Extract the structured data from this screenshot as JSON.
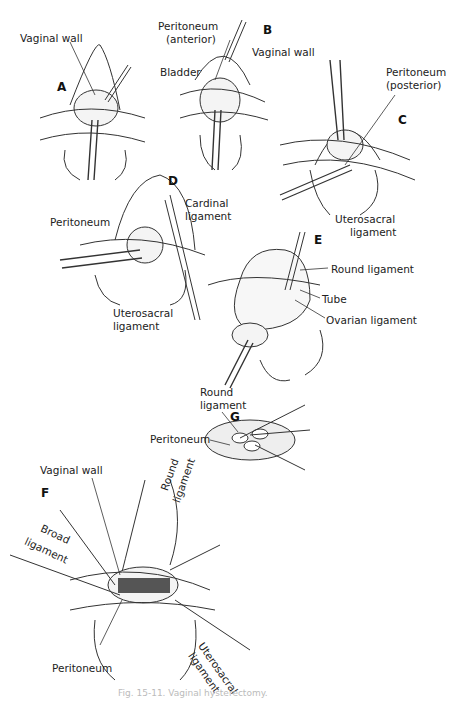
{
  "figure": {
    "caption": "Fig. 15-11. Vaginal hysterectomy.",
    "panels": [
      {
        "id": "A",
        "labels": [
          "Vaginal wall"
        ]
      },
      {
        "id": "B",
        "labels": [
          "Peritoneum (anterior)",
          "Bladder",
          "Vaginal wall"
        ]
      },
      {
        "id": "C",
        "labels": [
          "Peritoneum (posterior)",
          "Uterosacral ligament"
        ]
      },
      {
        "id": "D",
        "labels": [
          "Peritoneum",
          "Cardinal ligament",
          "Uterosacral ligament"
        ]
      },
      {
        "id": "E",
        "labels": [
          "Round ligament",
          "Tube",
          "Ovarian ligament"
        ]
      },
      {
        "id": "F",
        "labels": [
          "Vaginal wall",
          "Round ligament",
          "Broad ligament",
          "Peritoneum",
          "Uterosacral ligament"
        ]
      },
      {
        "id": "G",
        "labels": [
          "Round ligament",
          "Peritoneum"
        ]
      }
    ]
  },
  "letters": {
    "a": "A",
    "b": "B",
    "c": "C",
    "d": "D",
    "e": "E",
    "f": "F",
    "g": "G"
  },
  "labels": {
    "a_vaginal_wall": "Vaginal wall",
    "b_peritoneum_1": "Peritoneum",
    "b_peritoneum_2": "(anterior)",
    "b_bladder": "Bladder",
    "b_vaginal_wall": "Vaginal wall",
    "c_peritoneum_1": "Peritoneum",
    "c_peritoneum_2": "(posterior)",
    "c_uterosacral_1": "Uterosacral",
    "c_uterosacral_2": "ligament",
    "d_peritoneum": "Peritoneum",
    "d_cardinal_1": "Cardinal",
    "d_cardinal_2": "ligament",
    "d_uterosacral_1": "Uterosacral",
    "d_uterosacral_2": "ligament",
    "e_round": "Round ligament",
    "e_tube": "Tube",
    "e_ovarian": "Ovarian ligament",
    "g_round_1": "Round",
    "g_round_2": "ligament",
    "g_peritoneum": "Peritoneum",
    "f_vaginal_wall": "Vaginal wall",
    "f_round_1": "Round",
    "f_round_2": "ligament",
    "f_broad_1": "Broad",
    "f_broad_2": "ligament",
    "f_peritoneum": "Peritoneum",
    "f_uterosacral_1": "Uterosacral",
    "f_uterosacral_2": "ligament"
  }
}
